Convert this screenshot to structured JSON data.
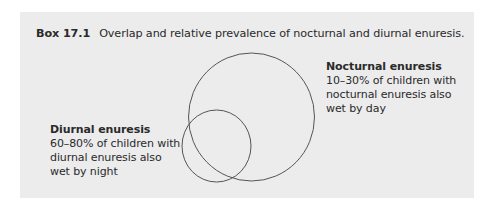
{
  "box": {
    "number": "Box 17.1",
    "caption": "Overlap and relative prevalence of nocturnal and diurnal enuresis.",
    "background": "#ececec"
  },
  "diagram": {
    "type": "venn",
    "circles": [
      {
        "name": "Nocturnal enuresis",
        "cx": 231.5,
        "cy": 105,
        "rx": 63,
        "ry": 64
      },
      {
        "name": "Diurnal enuresis",
        "cx": 196.5,
        "cy": 134,
        "rx": 34.5,
        "ry": 36
      }
    ],
    "stroke": "#555555"
  },
  "labels": {
    "nocturnal": {
      "heading": "Nocturnal enuresis",
      "lines": [
        "10–30% of children with",
        "nocturnal enuresis also",
        "wet by day"
      ]
    },
    "diurnal": {
      "heading": "Diurnal enuresis",
      "lines": [
        "60–80% of children with",
        "diurnal enuresis also",
        "wet by night"
      ]
    }
  }
}
